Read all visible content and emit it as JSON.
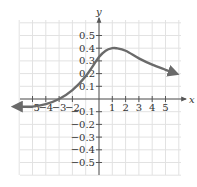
{
  "chart_data": {
    "type": "line",
    "title": "",
    "xlabel": "x",
    "ylabel": "y",
    "xlim": [
      -6,
      6
    ],
    "ylim": [
      -0.6,
      0.6
    ],
    "grid": true,
    "x_ticks": [
      -5,
      -4,
      -3,
      -2,
      1,
      2,
      3,
      4,
      5
    ],
    "x_tick_labels": [
      "-5",
      "-4",
      "-3",
      "-2",
      "1",
      "2",
      "3",
      "4",
      "5"
    ],
    "y_ticks": [
      0.5,
      0.4,
      0.3,
      0.2,
      0.1,
      -0.1,
      -0.2,
      -0.3,
      -0.4,
      -0.5
    ],
    "y_tick_labels": [
      "0.5",
      "0.4",
      "0.3",
      "0.2",
      "0.1",
      "-0.1",
      "-0.2",
      "-0.3",
      "-0.4",
      "-0.5"
    ],
    "series": [
      {
        "name": "f(x)",
        "x": [
          -6,
          -5,
          -4,
          -3,
          -2,
          -1,
          0,
          0.5,
          1,
          1.3,
          2,
          3,
          4,
          5,
          5.8
        ],
        "y": [
          -0.06,
          -0.06,
          -0.04,
          0.0,
          0.07,
          0.18,
          0.33,
          0.38,
          0.4,
          0.4,
          0.38,
          0.32,
          0.27,
          0.23,
          0.2
        ],
        "color": "#6a6a6a",
        "arrows": "both"
      }
    ]
  },
  "colors": {
    "grid": "#e2e2e2",
    "axis": "#555555",
    "curve": "#6a6a6a"
  }
}
